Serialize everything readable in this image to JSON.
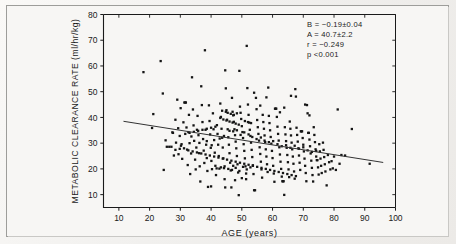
{
  "figure": {
    "background_color": "#f3f2f0",
    "frame_color": "#9d9d9a",
    "ink_color": "#1a1a1a"
  },
  "annotations": {
    "slope": "B = −0.19±0.04",
    "intercept": "A = 40.7±2.2",
    "correlation": "r = −0.249",
    "pvalue": "p  <0.001"
  },
  "chart_data": {
    "type": "scatter",
    "title": "",
    "xlabel": "AGE (years)",
    "ylabel": "METABOLIC CLEARANCE RATE (ml/hr/kg)",
    "xlim": [
      5,
      100
    ],
    "ylim": [
      5,
      80
    ],
    "xticks": [
      10,
      20,
      30,
      40,
      50,
      60,
      70,
      80,
      90,
      100
    ],
    "yticks": [
      10,
      20,
      30,
      40,
      50,
      60,
      70,
      80
    ],
    "xtick_labels": [
      "10",
      "20",
      "30",
      "40",
      "50",
      "60",
      "70",
      "80",
      "90",
      "100"
    ],
    "ytick_labels": [
      "10",
      "20",
      "30",
      "40",
      "50",
      "60",
      "70",
      "80"
    ],
    "grid": false,
    "legend": null,
    "marker": "square",
    "marker_size": 2.3,
    "marker_color": "#151515",
    "regression_line": {
      "equation": "y = 40.7 - 0.19x",
      "slope": -0.19,
      "intercept": 40.7,
      "x_start": 11.5,
      "x_end": 96.0,
      "y_start": 38.5,
      "y_end": 22.5,
      "color": "#333333"
    },
    "stats": {
      "B": -0.19,
      "B_se": 0.04,
      "A": 40.7,
      "A_se": 2.2,
      "r": -0.249,
      "p": "<0.001",
      "n": 351
    },
    "points": [
      [
        18.0,
        57.6
      ],
      [
        20.8,
        35.9
      ],
      [
        21.2,
        41.3
      ],
      [
        23.6,
        61.9
      ],
      [
        24.3,
        49.3
      ],
      [
        24.6,
        19.6
      ],
      [
        25.2,
        31.1
      ],
      [
        25.6,
        28.6
      ],
      [
        26.4,
        28.6
      ],
      [
        27.1,
        28.6
      ],
      [
        27.4,
        34.2
      ],
      [
        27.9,
        25.2
      ],
      [
        28.4,
        39.1
      ],
      [
        28.6,
        30.2
      ],
      [
        29.0,
        46.9
      ],
      [
        29.3,
        35.8
      ],
      [
        29.4,
        25.7
      ],
      [
        29.8,
        32.8
      ],
      [
        30.1,
        43.6
      ],
      [
        30.4,
        29.6
      ],
      [
        30.6,
        23.9
      ],
      [
        31.0,
        38.1
      ],
      [
        31.3,
        45.8
      ],
      [
        31.6,
        45.8
      ],
      [
        31.8,
        45.8
      ],
      [
        32.0,
        36.1
      ],
      [
        32.2,
        27.5
      ],
      [
        32.4,
        21.5
      ],
      [
        32.6,
        34.3
      ],
      [
        32.8,
        41.0
      ],
      [
        33.0,
        30.0
      ],
      [
        33.2,
        18.0
      ],
      [
        33.5,
        26.0
      ],
      [
        33.8,
        55.6
      ],
      [
        34.1,
        43.1
      ],
      [
        34.3,
        36.9
      ],
      [
        34.5,
        30.9
      ],
      [
        34.8,
        23.6
      ],
      [
        35.0,
        19.8
      ],
      [
        35.2,
        28.3
      ],
      [
        35.4,
        35.2
      ],
      [
        35.6,
        40.6
      ],
      [
        35.9,
        33.1
      ],
      [
        36.1,
        26.1
      ],
      [
        36.3,
        21.0
      ],
      [
        36.5,
        15.1
      ],
      [
        36.8,
        52.1
      ],
      [
        37.0,
        44.8
      ],
      [
        37.2,
        38.2
      ],
      [
        37.4,
        31.6
      ],
      [
        37.6,
        27.1
      ],
      [
        37.8,
        22.3
      ],
      [
        38.0,
        66.1
      ],
      [
        38.2,
        35.2
      ],
      [
        38.4,
        29.4
      ],
      [
        38.6,
        24.2
      ],
      [
        38.8,
        19.2
      ],
      [
        39.0,
        13.0
      ],
      [
        39.3,
        44.7
      ],
      [
        39.5,
        38.6
      ],
      [
        39.7,
        33.4
      ],
      [
        39.9,
        28.2
      ],
      [
        40.1,
        23.1
      ],
      [
        40.3,
        19.9
      ],
      [
        40.6,
        41.6
      ],
      [
        40.8,
        35.4
      ],
      [
        41.0,
        31.2
      ],
      [
        41.2,
        26.3
      ],
      [
        41.4,
        21.2
      ],
      [
        41.6,
        17.6
      ],
      [
        41.9,
        37.0
      ],
      [
        42.1,
        33.6
      ],
      [
        42.3,
        29.4
      ],
      [
        42.5,
        25.0
      ],
      [
        42.7,
        20.1
      ],
      [
        43.0,
        45.4
      ],
      [
        43.2,
        40.2
      ],
      [
        43.4,
        35.6
      ],
      [
        43.6,
        32.1
      ],
      [
        43.8,
        28.3
      ],
      [
        44.0,
        24.1
      ],
      [
        44.2,
        20.3
      ],
      [
        44.4,
        16.0
      ],
      [
        44.6,
        58.3
      ],
      [
        44.8,
        51.3
      ],
      [
        45.0,
        42.8
      ],
      [
        45.2,
        39.1
      ],
      [
        45.4,
        35.4
      ],
      [
        45.6,
        32.3
      ],
      [
        45.8,
        29.4
      ],
      [
        46.0,
        26.1
      ],
      [
        46.2,
        22.4
      ],
      [
        46.4,
        19.4
      ],
      [
        46.6,
        12.8
      ],
      [
        46.8,
        47.6
      ],
      [
        47.0,
        42.2
      ],
      [
        47.2,
        40.8
      ],
      [
        47.4,
        38.3
      ],
      [
        47.6,
        35.4
      ],
      [
        47.8,
        33.1
      ],
      [
        48.0,
        30.6
      ],
      [
        48.2,
        28.0
      ],
      [
        48.4,
        25.0
      ],
      [
        48.6,
        21.8
      ],
      [
        48.8,
        18.6
      ],
      [
        49.0,
        9.8
      ],
      [
        49.2,
        58.1
      ],
      [
        49.4,
        44.2
      ],
      [
        49.6,
        41.8
      ],
      [
        49.8,
        39.4
      ],
      [
        50.0,
        36.6
      ],
      [
        50.2,
        34.3
      ],
      [
        50.4,
        32.0
      ],
      [
        50.6,
        29.6
      ],
      [
        50.8,
        27.0
      ],
      [
        51.0,
        24.1
      ],
      [
        51.2,
        21.0
      ],
      [
        51.4,
        18.2
      ],
      [
        51.6,
        67.8
      ],
      [
        51.8,
        51.4
      ],
      [
        52.0,
        45.0
      ],
      [
        52.2,
        41.0
      ],
      [
        52.4,
        38.0
      ],
      [
        52.6,
        35.2
      ],
      [
        52.8,
        32.8
      ],
      [
        53.0,
        30.2
      ],
      [
        53.2,
        27.4
      ],
      [
        53.4,
        24.6
      ],
      [
        53.6,
        21.4
      ],
      [
        53.8,
        18.0
      ],
      [
        54.0,
        11.7
      ],
      [
        54.3,
        11.7
      ],
      [
        54.6,
        47.6
      ],
      [
        54.8,
        43.2
      ],
      [
        55.0,
        39.0
      ],
      [
        55.2,
        36.2
      ],
      [
        55.4,
        33.6
      ],
      [
        55.6,
        31.0
      ],
      [
        55.8,
        28.4
      ],
      [
        56.0,
        25.8
      ],
      [
        56.2,
        22.8
      ],
      [
        56.4,
        19.8
      ],
      [
        56.6,
        16.6
      ],
      [
        56.8,
        41.0
      ],
      [
        57.0,
        38.2
      ],
      [
        57.2,
        35.6
      ],
      [
        57.4,
        33.0
      ],
      [
        57.6,
        30.4
      ],
      [
        57.8,
        27.6
      ],
      [
        58.0,
        24.8
      ],
      [
        58.2,
        21.8
      ],
      [
        58.4,
        18.8
      ],
      [
        58.6,
        51.6
      ],
      [
        58.8,
        40.6
      ],
      [
        59.0,
        37.8
      ],
      [
        59.2,
        35.0
      ],
      [
        59.4,
        32.4
      ],
      [
        59.6,
        29.8
      ],
      [
        59.8,
        27.0
      ],
      [
        60.0,
        24.2
      ],
      [
        60.2,
        21.2
      ],
      [
        60.4,
        18.2
      ],
      [
        60.6,
        15.0
      ],
      [
        60.8,
        43.4
      ],
      [
        61.0,
        43.4
      ],
      [
        61.2,
        43.4
      ],
      [
        61.4,
        40.2
      ],
      [
        61.6,
        36.4
      ],
      [
        61.8,
        33.6
      ],
      [
        62.0,
        31.0
      ],
      [
        62.2,
        28.4
      ],
      [
        62.4,
        25.6
      ],
      [
        62.6,
        22.8
      ],
      [
        62.8,
        20.0
      ],
      [
        63.0,
        17.0
      ],
      [
        63.2,
        15.2
      ],
      [
        63.4,
        15.2
      ],
      [
        63.6,
        15.2
      ],
      [
        63.8,
        9.9
      ],
      [
        64.0,
        36.2
      ],
      [
        64.2,
        33.4
      ],
      [
        64.4,
        30.8
      ],
      [
        64.6,
        28.2
      ],
      [
        64.8,
        25.4
      ],
      [
        65.0,
        22.6
      ],
      [
        65.2,
        19.8
      ],
      [
        65.4,
        16.8
      ],
      [
        65.6,
        38.4
      ],
      [
        65.8,
        35.6
      ],
      [
        66.0,
        33.0
      ],
      [
        66.2,
        30.2
      ],
      [
        66.4,
        27.6
      ],
      [
        66.6,
        24.8
      ],
      [
        66.8,
        22.0
      ],
      [
        67.0,
        19.0
      ],
      [
        67.2,
        16.2
      ],
      [
        67.4,
        51.0
      ],
      [
        67.6,
        48.1
      ],
      [
        67.8,
        36.0
      ],
      [
        68.0,
        33.2
      ],
      [
        68.2,
        30.6
      ],
      [
        68.4,
        28.0
      ],
      [
        68.6,
        25.2
      ],
      [
        68.8,
        22.4
      ],
      [
        69.0,
        19.6
      ],
      [
        69.2,
        34.6
      ],
      [
        69.4,
        34.6
      ],
      [
        69.6,
        34.6
      ],
      [
        69.8,
        32.0
      ],
      [
        70.0,
        29.4
      ],
      [
        70.2,
        26.8
      ],
      [
        70.4,
        24.0
      ],
      [
        70.6,
        21.2
      ],
      [
        70.8,
        18.4
      ],
      [
        71.0,
        15.2
      ],
      [
        71.2,
        44.8
      ],
      [
        71.4,
        41.6
      ],
      [
        71.6,
        34.0
      ],
      [
        71.8,
        34.0
      ],
      [
        72.0,
        31.4
      ],
      [
        72.2,
        28.8
      ],
      [
        72.4,
        26.0
      ],
      [
        72.6,
        23.2
      ],
      [
        72.8,
        20.4
      ],
      [
        73.0,
        17.6
      ],
      [
        73.2,
        15.1
      ],
      [
        73.4,
        36.2
      ],
      [
        73.6,
        33.2
      ],
      [
        73.8,
        30.4
      ],
      [
        74.0,
        27.6
      ],
      [
        74.2,
        24.8
      ],
      [
        74.4,
        23.4
      ],
      [
        74.6,
        23.4
      ],
      [
        74.8,
        20.6
      ],
      [
        75.0,
        17.8
      ],
      [
        75.2,
        29.6
      ],
      [
        75.4,
        26.8
      ],
      [
        75.6,
        24.0
      ],
      [
        75.8,
        21.2
      ],
      [
        76.0,
        18.4
      ],
      [
        76.4,
        30.2
      ],
      [
        76.6,
        27.4
      ],
      [
        76.8,
        24.6
      ],
      [
        77.0,
        21.8
      ],
      [
        77.2,
        19.0
      ],
      [
        77.6,
        13.6
      ],
      [
        78.0,
        25.4
      ],
      [
        78.4,
        22.6
      ],
      [
        78.8,
        19.8
      ],
      [
        79.2,
        23.0
      ],
      [
        79.6,
        20.2
      ],
      [
        80.0,
        24.8
      ],
      [
        80.6,
        19.6
      ],
      [
        81.2,
        43.1
      ],
      [
        81.8,
        22.0
      ],
      [
        82.4,
        25.4
      ],
      [
        83.6,
        25.2
      ],
      [
        85.8,
        35.5
      ],
      [
        91.6,
        22.0
      ],
      [
        27.6,
        34.0
      ],
      [
        30.2,
        29.0
      ],
      [
        33.6,
        32.6
      ],
      [
        36.2,
        30.1
      ],
      [
        38.6,
        30.8
      ],
      [
        40.2,
        29.2
      ],
      [
        42.8,
        31.8
      ],
      [
        44.2,
        32.8
      ],
      [
        46.0,
        34.8
      ],
      [
        47.2,
        34.6
      ],
      [
        48.4,
        35.0
      ],
      [
        49.6,
        33.2
      ],
      [
        50.8,
        34.2
      ],
      [
        52.2,
        33.4
      ],
      [
        53.4,
        32.4
      ],
      [
        54.8,
        31.6
      ],
      [
        56.2,
        32.2
      ],
      [
        57.4,
        31.0
      ],
      [
        58.8,
        30.4
      ],
      [
        60.2,
        30.8
      ],
      [
        61.6,
        29.6
      ],
      [
        63.0,
        28.8
      ],
      [
        64.4,
        29.2
      ],
      [
        65.8,
        28.2
      ],
      [
        67.2,
        29.0
      ],
      [
        68.6,
        27.8
      ],
      [
        70.0,
        28.4
      ],
      [
        71.4,
        27.2
      ],
      [
        72.8,
        26.6
      ],
      [
        74.2,
        27.0
      ],
      [
        43.0,
        39.8
      ],
      [
        44.0,
        39.2
      ],
      [
        45.0,
        38.8
      ],
      [
        46.0,
        38.4
      ],
      [
        47.0,
        38.0
      ],
      [
        48.0,
        37.6
      ],
      [
        49.0,
        37.2
      ],
      [
        45.4,
        41.8
      ],
      [
        46.4,
        41.4
      ],
      [
        47.4,
        41.0
      ],
      [
        48.4,
        41.6
      ],
      [
        44.8,
        42.2
      ],
      [
        43.6,
        42.6
      ],
      [
        51.0,
        38.6
      ],
      [
        52.0,
        38.2
      ],
      [
        53.0,
        37.8
      ],
      [
        35.8,
        34.8
      ],
      [
        34.4,
        34.4
      ],
      [
        33.0,
        34.0
      ],
      [
        31.6,
        33.6
      ],
      [
        37.2,
        35.2
      ],
      [
        38.6,
        35.6
      ],
      [
        40.0,
        36.0
      ],
      [
        41.4,
        36.4
      ],
      [
        29.8,
        27.8
      ],
      [
        28.4,
        27.4
      ],
      [
        31.2,
        28.0
      ],
      [
        32.6,
        27.2
      ],
      [
        34.0,
        26.8
      ],
      [
        35.4,
        26.4
      ],
      [
        36.8,
        26.0
      ],
      [
        38.2,
        25.6
      ],
      [
        39.6,
        25.2
      ],
      [
        41.0,
        24.8
      ],
      [
        42.4,
        24.4
      ],
      [
        43.8,
        24.0
      ],
      [
        45.2,
        23.6
      ],
      [
        46.6,
        23.2
      ],
      [
        48.0,
        22.8
      ],
      [
        49.4,
        22.4
      ],
      [
        50.8,
        22.0
      ],
      [
        52.2,
        21.6
      ],
      [
        53.6,
        21.2
      ],
      [
        55.0,
        20.8
      ],
      [
        56.4,
        20.4
      ],
      [
        57.8,
        20.0
      ],
      [
        59.2,
        19.6
      ],
      [
        60.6,
        19.2
      ],
      [
        62.0,
        18.8
      ],
      [
        63.4,
        18.4
      ],
      [
        64.8,
        18.0
      ],
      [
        66.2,
        17.6
      ],
      [
        67.6,
        17.2
      ],
      [
        45.6,
        20.0
      ],
      [
        46.8,
        19.6
      ],
      [
        48.0,
        20.4
      ],
      [
        49.2,
        19.2
      ],
      [
        50.4,
        20.8
      ],
      [
        51.6,
        19.8
      ],
      [
        52.8,
        20.6
      ],
      [
        47.2,
        21.2
      ],
      [
        44.4,
        21.0
      ],
      [
        43.2,
        20.6
      ],
      [
        41.8,
        20.2
      ],
      [
        50.0,
        16.4
      ],
      [
        51.4,
        16.0
      ],
      [
        47.8,
        15.6
      ],
      [
        44.6,
        12.8
      ],
      [
        40.0,
        13.2
      ],
      [
        58.0,
        47.8
      ],
      [
        56.0,
        44.6
      ],
      [
        54.0,
        49.6
      ],
      [
        62.4,
        42.0
      ],
      [
        63.8,
        43.8
      ],
      [
        66.0,
        48.4
      ],
      [
        70.6,
        45.0
      ],
      [
        72.0,
        40.8
      ]
    ]
  }
}
